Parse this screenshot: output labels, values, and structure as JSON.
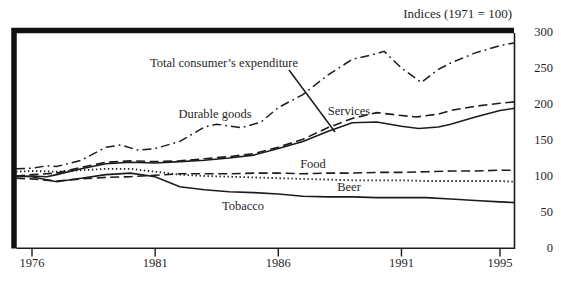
{
  "page": {
    "background": "#ffffff",
    "ink": "#1c1c1c"
  },
  "chart_data": {
    "type": "line",
    "title": "Indices (1971 = 100)",
    "xlabel": "",
    "ylabel": "Indices (1971 = 100)",
    "xlim": [
      1975.35,
      1995.6
    ],
    "ylim": [
      0,
      300
    ],
    "xticks": [
      "1976",
      "1981",
      "1986",
      "1991",
      "1995"
    ],
    "xtick_years": [
      1976,
      1981,
      1986,
      1991,
      1995
    ],
    "yticks": [
      0,
      50,
      100,
      150,
      200,
      250,
      300
    ],
    "grid": false,
    "legend": "inline-labels",
    "series": [
      {
        "name": "Total consumer’s expenditure",
        "style": "solid",
        "points": [
          [
            1975.35,
            99
          ],
          [
            1976,
            100
          ],
          [
            1976.6,
            99
          ],
          [
            1977,
            102
          ],
          [
            1978,
            110
          ],
          [
            1979,
            117
          ],
          [
            1980,
            119
          ],
          [
            1981,
            118
          ],
          [
            1982,
            120
          ],
          [
            1983,
            122
          ],
          [
            1984,
            125
          ],
          [
            1985,
            129
          ],
          [
            1986,
            138
          ],
          [
            1987,
            148
          ],
          [
            1988,
            162
          ],
          [
            1989,
            174
          ],
          [
            1990,
            175
          ],
          [
            1991,
            169
          ],
          [
            1991.7,
            166
          ],
          [
            1992.5,
            168
          ],
          [
            1993,
            172
          ],
          [
            1994,
            182
          ],
          [
            1995,
            191
          ],
          [
            1995.6,
            194
          ]
        ]
      },
      {
        "name": "Durable goods",
        "style": "dashdot",
        "points": [
          [
            1975.35,
            110
          ],
          [
            1976,
            111
          ],
          [
            1976.6,
            114
          ],
          [
            1977,
            113
          ],
          [
            1978,
            122
          ],
          [
            1979,
            140
          ],
          [
            1979.6,
            143
          ],
          [
            1980.3,
            136
          ],
          [
            1981,
            138
          ],
          [
            1982,
            148
          ],
          [
            1983,
            168
          ],
          [
            1983.5,
            172
          ],
          [
            1984.5,
            167
          ],
          [
            1985.3,
            175
          ],
          [
            1986,
            195
          ],
          [
            1987,
            213
          ],
          [
            1988,
            240
          ],
          [
            1989,
            262
          ],
          [
            1990,
            270
          ],
          [
            1990.3,
            273
          ],
          [
            1991,
            250
          ],
          [
            1991.8,
            230
          ],
          [
            1992.5,
            248
          ],
          [
            1993,
            257
          ],
          [
            1994,
            271
          ],
          [
            1995,
            281
          ],
          [
            1995.6,
            285
          ]
        ]
      },
      {
        "name": "Services",
        "style": "dashed",
        "points": [
          [
            1975.35,
            100
          ],
          [
            1976,
            102
          ],
          [
            1977,
            104
          ],
          [
            1978,
            112
          ],
          [
            1979,
            119
          ],
          [
            1980,
            121
          ],
          [
            1981,
            120
          ],
          [
            1982,
            121
          ],
          [
            1983,
            124
          ],
          [
            1984,
            127
          ],
          [
            1985,
            131
          ],
          [
            1986,
            140
          ],
          [
            1987,
            151
          ],
          [
            1988,
            167
          ],
          [
            1989,
            180
          ],
          [
            1990,
            188
          ],
          [
            1991,
            184
          ],
          [
            1991.6,
            182
          ],
          [
            1992.5,
            186
          ],
          [
            1993,
            191
          ],
          [
            1994,
            197
          ],
          [
            1995,
            201
          ],
          [
            1995.6,
            203
          ]
        ]
      },
      {
        "name": "Food",
        "style": "dashed",
        "points": [
          [
            1975.35,
            97
          ],
          [
            1976,
            96
          ],
          [
            1977,
            93
          ],
          [
            1978,
            96
          ],
          [
            1979,
            98
          ],
          [
            1980,
            99
          ],
          [
            1981,
            101
          ],
          [
            1982,
            103
          ],
          [
            1983,
            103
          ],
          [
            1984,
            103
          ],
          [
            1985,
            104
          ],
          [
            1986,
            104
          ],
          [
            1987,
            103
          ],
          [
            1988,
            104
          ],
          [
            1989,
            104
          ],
          [
            1990,
            105
          ],
          [
            1991,
            105
          ],
          [
            1992,
            106
          ],
          [
            1993,
            107
          ],
          [
            1994,
            107
          ],
          [
            1995,
            108
          ],
          [
            1995.6,
            108
          ]
        ]
      },
      {
        "name": "Beer",
        "style": "dotted",
        "points": [
          [
            1975.35,
            106
          ],
          [
            1976,
            107
          ],
          [
            1977,
            106
          ],
          [
            1978,
            108
          ],
          [
            1979,
            110
          ],
          [
            1980,
            110
          ],
          [
            1981,
            106
          ],
          [
            1982,
            102
          ],
          [
            1983,
            100
          ],
          [
            1984,
            99
          ],
          [
            1985,
            98
          ],
          [
            1986,
            97
          ],
          [
            1987,
            96
          ],
          [
            1988,
            95
          ],
          [
            1989,
            94
          ],
          [
            1990,
            94
          ],
          [
            1991,
            94
          ],
          [
            1992,
            93
          ],
          [
            1993,
            93
          ],
          [
            1994,
            93
          ],
          [
            1995,
            93
          ],
          [
            1995.6,
            92
          ]
        ]
      },
      {
        "name": "Tobacco",
        "style": "solid",
        "points": [
          [
            1975.35,
            100
          ],
          [
            1976,
            99
          ],
          [
            1977,
            92
          ],
          [
            1978,
            97
          ],
          [
            1979,
            102
          ],
          [
            1980,
            104
          ],
          [
            1981,
            99
          ],
          [
            1982,
            85
          ],
          [
            1983,
            81
          ],
          [
            1984,
            78
          ],
          [
            1985,
            77
          ],
          [
            1986,
            75
          ],
          [
            1987,
            72
          ],
          [
            1988,
            71
          ],
          [
            1989,
            71
          ],
          [
            1990,
            70
          ],
          [
            1991,
            70
          ],
          [
            1992,
            70
          ],
          [
            1993,
            68
          ],
          [
            1994,
            66
          ],
          [
            1995,
            64
          ],
          [
            1995.6,
            63
          ]
        ]
      }
    ]
  }
}
